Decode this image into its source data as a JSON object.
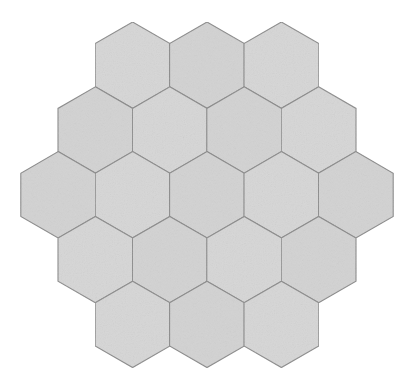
{
  "figure": {
    "type": "honeycomb-tiling",
    "background_color": "#ffffff",
    "canvas_width": 414,
    "canvas_height": 392
  },
  "style": {
    "fill_color": "#d6d6d6",
    "fill_color_alt": "#d2d2d2",
    "stroke_color": "#8a8a8a",
    "stroke_width": 1.1,
    "texture": "noise-grain",
    "texture_opacity": 0.16,
    "hex_orientation": "pointy-top"
  },
  "geometry": {
    "circumradius": 43.2,
    "hex_width": 74.8,
    "hex_height": 86.4,
    "row_pitch": 64.8,
    "column_pitch": 74.8,
    "bounds": {
      "x_min": 20,
      "x_max": 394,
      "y_min": 22,
      "y_max": 372
    }
  },
  "chart_data": {
    "type": "scatter",
    "xlabel": "",
    "ylabel": "",
    "grid": false,
    "legend": false,
    "rows_per_line": [
      3,
      4,
      5,
      4,
      3
    ],
    "total_cells": 19,
    "categories": [
      "row-1",
      "row-2",
      "row-3",
      "row-4",
      "row-5"
    ],
    "values": [
      3,
      4,
      5,
      4,
      3
    ],
    "cells": [
      {
        "id": "r1c1",
        "row": 1,
        "col": 1,
        "cx": 132.6,
        "cy": 65.2
      },
      {
        "id": "r1c2",
        "row": 1,
        "col": 2,
        "cx": 207.0,
        "cy": 65.2
      },
      {
        "id": "r1c3",
        "row": 1,
        "col": 3,
        "cx": 281.4,
        "cy": 65.2
      },
      {
        "id": "r2c1",
        "row": 2,
        "col": 1,
        "cx": 95.4,
        "cy": 130.0
      },
      {
        "id": "r2c2",
        "row": 2,
        "col": 2,
        "cx": 169.8,
        "cy": 130.0
      },
      {
        "id": "r2c3",
        "row": 2,
        "col": 3,
        "cx": 244.2,
        "cy": 130.0
      },
      {
        "id": "r2c4",
        "row": 2,
        "col": 4,
        "cx": 318.6,
        "cy": 130.0
      },
      {
        "id": "r3c1",
        "row": 3,
        "col": 1,
        "cx": 58.2,
        "cy": 194.8
      },
      {
        "id": "r3c2",
        "row": 3,
        "col": 2,
        "cx": 132.6,
        "cy": 194.8
      },
      {
        "id": "r3c3",
        "row": 3,
        "col": 3,
        "cx": 207.0,
        "cy": 194.8
      },
      {
        "id": "r3c4",
        "row": 3,
        "col": 4,
        "cx": 281.4,
        "cy": 194.8
      },
      {
        "id": "r3c5",
        "row": 3,
        "col": 5,
        "cx": 355.8,
        "cy": 194.8
      },
      {
        "id": "r4c1",
        "row": 4,
        "col": 1,
        "cx": 95.4,
        "cy": 259.6
      },
      {
        "id": "r4c2",
        "row": 4,
        "col": 2,
        "cx": 169.8,
        "cy": 259.6
      },
      {
        "id": "r4c3",
        "row": 4,
        "col": 3,
        "cx": 244.2,
        "cy": 259.6
      },
      {
        "id": "r4c4",
        "row": 4,
        "col": 4,
        "cx": 318.6,
        "cy": 259.6
      },
      {
        "id": "r5c1",
        "row": 5,
        "col": 1,
        "cx": 132.6,
        "cy": 324.4
      },
      {
        "id": "r5c2",
        "row": 5,
        "col": 2,
        "cx": 207.0,
        "cy": 324.4
      },
      {
        "id": "r5c3",
        "row": 5,
        "col": 3,
        "cx": 281.4,
        "cy": 324.4
      }
    ]
  }
}
